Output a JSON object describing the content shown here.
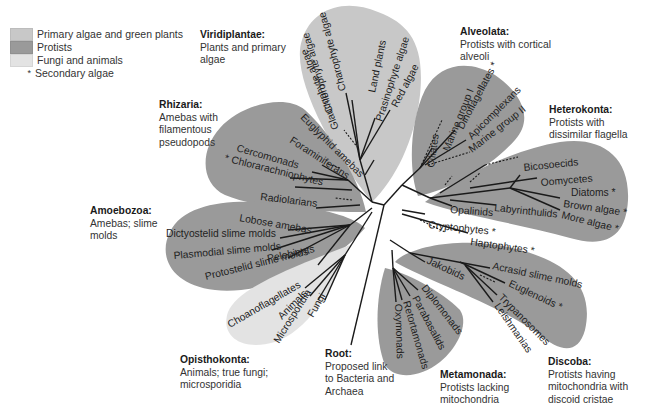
{
  "colors": {
    "primary_algae": "#c8c8c8",
    "protists": "#9a9a9a",
    "fungi_animals": "#e3e3e3",
    "branch": "#1a1a1a",
    "text": "#1e1e1e"
  },
  "legend": {
    "items": [
      {
        "label": "Primary algae and green plants",
        "swatch": "#c8c8c8"
      },
      {
        "label": "Protists",
        "swatch": "#9a9a9a"
      },
      {
        "label": "Fungi and animals",
        "swatch": "#e3e3e3"
      }
    ],
    "star_symbol": "*",
    "star_label": "Secondary algae"
  },
  "groups": {
    "viridiplantae": {
      "title": "Viridiplantae:",
      "desc": "Plants and primary algae"
    },
    "alveolata": {
      "title": "Alveolata:",
      "desc": "Protists with cortical alveoli"
    },
    "heterokonta": {
      "title": "Heterokonta:",
      "desc": "Protists with dissimilar flagella"
    },
    "rhizaria": {
      "title": "Rhizaria:",
      "desc": "Amebas with filamentous pseudopods"
    },
    "amoebozoa": {
      "title": "Amoebozoa:",
      "desc": "Amebas; slime molds"
    },
    "opisthokonta": {
      "title": "Opisthokonta:",
      "desc": "Animals; true fungi; microsporidia"
    },
    "root": {
      "title": "Root:",
      "desc": "Proposed link to Bacteria and Archaea"
    },
    "metamonada": {
      "title": "Metamonada:",
      "desc": "Protists lacking mitochondria"
    },
    "discoba": {
      "title": "Discoba:",
      "desc": "Protists having mitochondria with discoid cristae"
    }
  },
  "taxa": {
    "viridiplantae": [
      "Charophyte algae",
      "Chlorophyte algae",
      "Land plants",
      "Prasinophyte algae",
      "Red algae",
      "Glaucophyte algae"
    ],
    "alveolata": [
      "Ciliates",
      "Marine group I",
      "Dinoflagellates *",
      "Apicomplexans",
      "Marine group II"
    ],
    "heterokonta": [
      "Bicosoecids",
      "Oomycetes",
      "Diatoms *",
      "Brown algae *",
      "More algae *",
      "Opalinids",
      "Labyrinthulids"
    ],
    "unplaced": [
      "Cryptophytes *",
      "Haptophytes *"
    ],
    "rhizaria": [
      "Euglyphid amebas",
      "Foraminiferans",
      "Cercomonads",
      "* Chlorarachniophytes",
      "Radiolarians"
    ],
    "amoebozoa": [
      "Lobose amebas",
      "Dictyostelid slime molds",
      "Plasmodial slime molds",
      "Protostelid slime molds",
      "Pelobionts"
    ],
    "opisthokonta": [
      "Choanoflagellates",
      "Animals",
      "Microsporidia",
      "Fungi"
    ],
    "metamonada": [
      "Diplomonads",
      "Parabasalids",
      "Retortamonads",
      "Oxymonads"
    ],
    "discoba": [
      "Jakobids",
      "Acrasid slime molds",
      "Euglenoids *",
      "Trypanosomes",
      "Leishmanias"
    ]
  }
}
